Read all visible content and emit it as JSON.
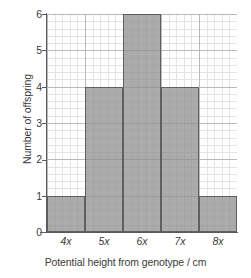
{
  "chart_data": {
    "type": "bar",
    "title": "",
    "categories": [
      "4x",
      "5x",
      "6x",
      "7x",
      "8x"
    ],
    "values": [
      1,
      4,
      6,
      4,
      1
    ],
    "xlabel": "Potential height from genotype / cm",
    "ylabel": "Number of offspring",
    "ylim": [
      0,
      6
    ],
    "yticks": [
      "0",
      "1",
      "2",
      "3",
      "4",
      "5",
      "6"
    ],
    "ytick_values": [
      0,
      1,
      2,
      3,
      4,
      5,
      6
    ],
    "grid": true,
    "grid_style": "graph-paper",
    "legend": "none",
    "bar_fill_color": "#8a8a8a",
    "bar_edge_color": "#5f5f5f",
    "axis_color": "#5a5a5a",
    "major_grid_color": "#b9b9b9",
    "minor_grid_color": "#e4e4e4",
    "text_color": "#3b3b3b",
    "background_color": "#ffffff"
  }
}
